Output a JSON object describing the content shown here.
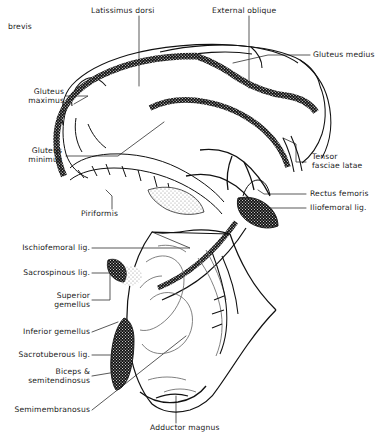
{
  "figure": {
    "title": "brevis",
    "type": "anatomical-line-drawing",
    "background_color": "#ffffff",
    "ink_color": "#111111",
    "leader_line_color": "#3b3b3b"
  },
  "labels": [
    {
      "id": "brevis",
      "text": "brevis",
      "x": 8,
      "y": 22,
      "align": "left"
    },
    {
      "id": "latissimus-dorsi",
      "text": "Latissimus dorsi",
      "x": 91,
      "y": 6,
      "align": "left"
    },
    {
      "id": "external-oblique",
      "text": "External oblique",
      "x": 212,
      "y": 6,
      "align": "left"
    },
    {
      "id": "gluteus-medius",
      "text": "Gluteus medius",
      "x": 313,
      "y": 52,
      "align": "left"
    },
    {
      "id": "gluteus-maximus",
      "text": "Gluteus\nmaximus",
      "x": 63,
      "y": 89,
      "align": "right"
    },
    {
      "id": "gluteus-minimus",
      "text": "Gluteus\nminimus",
      "x": 61,
      "y": 147,
      "align": "right"
    },
    {
      "id": "tensor-fasciae-latae",
      "text": "Tensor\nfasciae latae",
      "x": 312,
      "y": 155,
      "align": "left"
    },
    {
      "id": "piriformis",
      "text": "Piriformis",
      "x": 81,
      "y": 211,
      "align": "left"
    },
    {
      "id": "rectus-femoris",
      "text": "Rectus femoris",
      "x": 312,
      "y": 191,
      "align": "left"
    },
    {
      "id": "iliofemoral-lig",
      "text": "Iliofemoral lig.",
      "x": 312,
      "y": 206,
      "align": "left"
    },
    {
      "id": "ischiofemoral-lig",
      "text": "Ischiofemoral lig.",
      "x": 88,
      "y": 246,
      "align": "right"
    },
    {
      "id": "sacrospinous-lig",
      "text": "Sacrospinous lig.",
      "x": 88,
      "y": 270,
      "align": "right"
    },
    {
      "id": "superior-gemellus",
      "text": "Superior\ngemellus",
      "x": 88,
      "y": 292,
      "align": "right"
    },
    {
      "id": "inferior-gemellus",
      "text": "Inferior gemellus",
      "x": 88,
      "y": 330,
      "align": "right"
    },
    {
      "id": "sacrotuberous-lig",
      "text": "Sacrotuberous lig.",
      "x": 88,
      "y": 352,
      "align": "right"
    },
    {
      "id": "biceps-semitendinosus",
      "text": "Biceps &\nsemitendinosus",
      "x": 88,
      "y": 370,
      "align": "right"
    },
    {
      "id": "semimembranosus",
      "text": "Semimembranosus",
      "x": 88,
      "y": 408,
      "align": "right"
    },
    {
      "id": "adductor-magnus",
      "text": "Adductor magnus",
      "x": 150,
      "y": 425,
      "align": "left"
    }
  ],
  "structures": [
    {
      "id": "gluteus-maximus-band",
      "name": "Gluteus maximus",
      "fill": "stipple-coarse"
    },
    {
      "id": "gluteus-medius-band",
      "name": "Gluteus medius",
      "fill": "stipple-coarse"
    },
    {
      "id": "gluteus-minimus-band",
      "name": "Gluteus minimus",
      "fill": "outline"
    },
    {
      "id": "piriformis-patch",
      "name": "Piriformis",
      "fill": "stipple-light"
    },
    {
      "id": "iliofemoral-patch",
      "name": "Iliofemoral lig.",
      "fill": "stipple-dense"
    },
    {
      "id": "sacrospinous-patch",
      "name": "Sacrospinous lig.",
      "fill": "stipple-light"
    },
    {
      "id": "sacrotuberous-patch",
      "name": "Sacrotuberous lig.",
      "fill": "stipple-dense"
    },
    {
      "id": "pelvis-outline",
      "name": "Pelvis / hip bone",
      "fill": "outline"
    },
    {
      "id": "femur-outline",
      "name": "Femur",
      "fill": "outline"
    }
  ]
}
